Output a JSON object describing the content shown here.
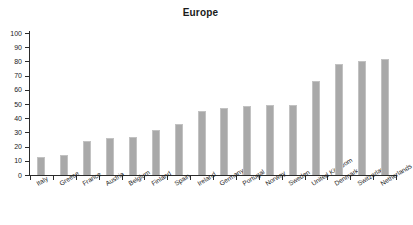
{
  "chart": {
    "title": "Europe"
  },
  "chart_data": {
    "type": "bar",
    "title": "Europe",
    "xlabel": "",
    "ylabel": "",
    "ylim": [
      0,
      100
    ],
    "yticks": [
      0,
      10,
      20,
      30,
      40,
      50,
      60,
      70,
      80,
      90,
      100
    ],
    "grid": false,
    "legend": null,
    "bar_color": "#a9a9a9",
    "bar_edge_color": "#c2c2c2",
    "categories": [
      "Italy",
      "Greece",
      "France",
      "Austria",
      "Belgium",
      "Finland",
      "Spain",
      "Ireland",
      "Germany",
      "Portugal",
      "Norway",
      "Sweden",
      "United Kingdom",
      "Denmark",
      "Switzerland",
      "Netherlands"
    ],
    "values": [
      13,
      14,
      24,
      26,
      27,
      32,
      36,
      45,
      47,
      48.5,
      49,
      49.5,
      66,
      78.5,
      80,
      82
    ]
  }
}
